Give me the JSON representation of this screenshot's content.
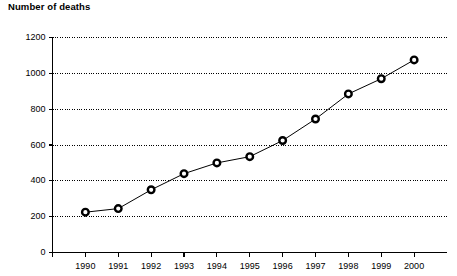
{
  "chart_data": {
    "type": "line",
    "title": "Number of deaths",
    "xlabel": "",
    "ylabel": "",
    "categories": [
      "1990",
      "1991",
      "1992",
      "1993",
      "1994",
      "1995",
      "1996",
      "1997",
      "1998",
      "1999",
      "2000"
    ],
    "values": [
      225,
      245,
      350,
      440,
      500,
      535,
      625,
      745,
      885,
      970,
      1075
    ],
    "series": [
      {
        "name": "Number of deaths",
        "values": [
          225,
          245,
          350,
          440,
          500,
          535,
          625,
          745,
          885,
          970,
          1075
        ]
      }
    ],
    "ylim": [
      0,
      1200
    ],
    "yticks": [
      0,
      200,
      400,
      600,
      800,
      1000,
      1200
    ],
    "ytick_labels": [
      "0",
      "200",
      "400",
      "600",
      "800",
      "1000",
      "1200"
    ],
    "grid": "horizontal-dotted",
    "legend": "none",
    "marker": "open-circle",
    "line_color": "#000000",
    "marker_fill": "#ffffff",
    "marker_stroke": "#000000",
    "grid_color": "#000000",
    "axis_color": "#000000"
  }
}
